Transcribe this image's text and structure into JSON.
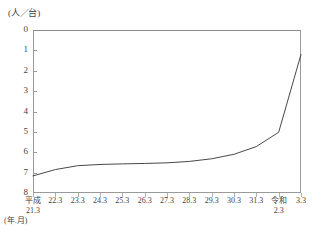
{
  "chart_data": {
    "type": "line",
    "title": "",
    "subtitle": "",
    "xlabel": "(年.月)",
    "ylabel": "(人／台)",
    "y_axis_inverted": true,
    "ylim": [
      0,
      8
    ],
    "yticks": [
      0,
      1,
      2,
      3,
      4,
      5,
      6,
      7,
      8
    ],
    "ytick_labels": [
      "0",
      "1",
      "2",
      "3",
      "4",
      "5",
      "6",
      "7",
      "8"
    ],
    "grid": false,
    "legend": "none",
    "categories": [
      "平成21.3",
      "22.3",
      "23.3",
      "24.3",
      "25.3",
      "26.3",
      "27.3",
      "28.3",
      "29.3",
      "30.3",
      "31.3",
      "令和2.3",
      "3.3"
    ],
    "x_tick_primary": [
      "平成",
      "22.3",
      "23.3",
      "24.3",
      "25.3",
      "26.3",
      "27.3",
      "28.3",
      "29.3",
      "30.3",
      "31.3",
      "令和",
      "3.3"
    ],
    "x_tick_secondary": {
      "first": "21.3",
      "reiwa": "2.3"
    },
    "series": [
      {
        "name": "人口一台当たり",
        "values": [
          7.16,
          6.85,
          6.66,
          6.6,
          6.57,
          6.55,
          6.52,
          6.45,
          6.32,
          6.1,
          5.72,
          5.02,
          1.2
        ]
      }
    ]
  },
  "axis_unit_label": "(人／台)",
  "colors": {
    "line": "#333333",
    "frame": "#9a9a9a",
    "tick": "#b0b0b0",
    "text": "#3f3f3f",
    "background": "#ffffff"
  }
}
